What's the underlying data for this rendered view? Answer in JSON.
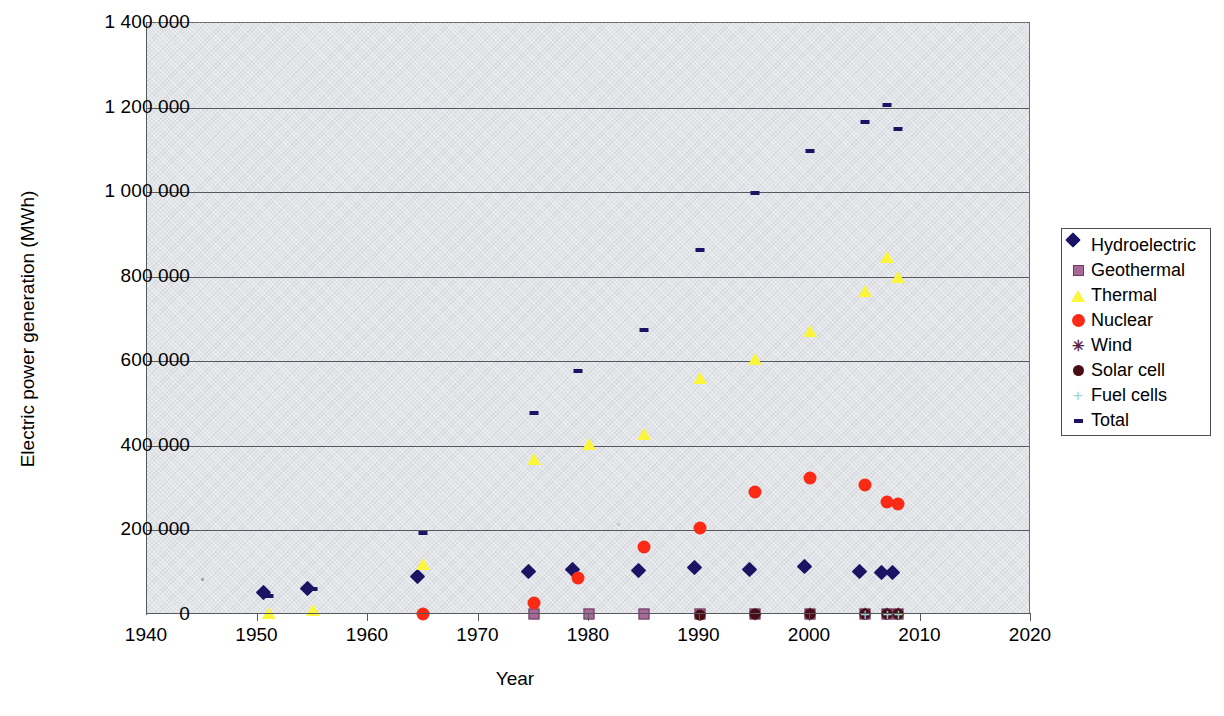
{
  "chart_data": {
    "type": "scatter",
    "title": "",
    "xlabel": "Year",
    "ylabel": "Electric power generation (MWh)",
    "xlim": [
      1940,
      2020
    ],
    "ylim": [
      0,
      1400000
    ],
    "xticks": [
      1940,
      1950,
      1960,
      1970,
      1980,
      1990,
      2000,
      2010,
      2020
    ],
    "yticks": [
      0,
      200000,
      400000,
      600000,
      800000,
      1000000,
      1200000,
      1400000
    ],
    "ytick_labels": [
      "0",
      "200 000",
      "400 000",
      "600 000",
      "800 000",
      "1 000 000",
      "1 200 000",
      "1 400 000"
    ],
    "xtick_labels": [
      "1940",
      "1950",
      "1960",
      "1970",
      "1980",
      "1990",
      "2000",
      "2010",
      "2020"
    ],
    "grid": "horizontal",
    "legend_position": "right",
    "plot_background": "#e3e5e9",
    "series": [
      {
        "name": "Hydroelectric",
        "marker": "diamond",
        "color": "#1b1464",
        "points": [
          {
            "x": 1951,
            "y": 40000
          },
          {
            "x": 1955,
            "y": 50000
          },
          {
            "x": 1965,
            "y": 78000
          },
          {
            "x": 1975,
            "y": 89000
          },
          {
            "x": 1979,
            "y": 95000
          },
          {
            "x": 1985,
            "y": 92000
          },
          {
            "x": 1990,
            "y": 100000
          },
          {
            "x": 1995,
            "y": 95000
          },
          {
            "x": 2000,
            "y": 102000
          },
          {
            "x": 2005,
            "y": 90000
          },
          {
            "x": 2007,
            "y": 88000
          },
          {
            "x": 2008,
            "y": 88000
          }
        ]
      },
      {
        "name": "Geothermal",
        "marker": "square",
        "color": "#a76a96",
        "points": [
          {
            "x": 1975,
            "y": 2000
          },
          {
            "x": 1980,
            "y": 2500
          },
          {
            "x": 1985,
            "y": 3000
          },
          {
            "x": 1990,
            "y": 3500
          },
          {
            "x": 1995,
            "y": 3500
          },
          {
            "x": 2000,
            "y": 3400
          },
          {
            "x": 2005,
            "y": 3200
          },
          {
            "x": 2007,
            "y": 3100
          },
          {
            "x": 2008,
            "y": 3000
          }
        ]
      },
      {
        "name": "Thermal",
        "marker": "triangle",
        "color": "#fbf53c",
        "points": [
          {
            "x": 1951,
            "y": 4000
          },
          {
            "x": 1955,
            "y": 12000
          },
          {
            "x": 1965,
            "y": 120000
          },
          {
            "x": 1975,
            "y": 368000
          },
          {
            "x": 1980,
            "y": 404000
          },
          {
            "x": 1985,
            "y": 428000
          },
          {
            "x": 1990,
            "y": 560000
          },
          {
            "x": 1995,
            "y": 605000
          },
          {
            "x": 2000,
            "y": 672000
          },
          {
            "x": 2005,
            "y": 766000
          },
          {
            "x": 2007,
            "y": 846000
          },
          {
            "x": 2008,
            "y": 800000
          }
        ]
      },
      {
        "name": "Nuclear",
        "marker": "circle",
        "color": "#fb2a14",
        "points": [
          {
            "x": 1965,
            "y": 3000
          },
          {
            "x": 1975,
            "y": 28000
          },
          {
            "x": 1979,
            "y": 88000
          },
          {
            "x": 1985,
            "y": 160000
          },
          {
            "x": 1990,
            "y": 205000
          },
          {
            "x": 1995,
            "y": 292000
          },
          {
            "x": 2000,
            "y": 325000
          },
          {
            "x": 2005,
            "y": 308000
          },
          {
            "x": 2007,
            "y": 268000
          },
          {
            "x": 2008,
            "y": 262000
          }
        ]
      },
      {
        "name": "Wind",
        "marker": "cross",
        "color": "#5b1f47",
        "points": [
          {
            "x": 1995,
            "y": 1000
          },
          {
            "x": 2000,
            "y": 1500
          },
          {
            "x": 2005,
            "y": 2000
          },
          {
            "x": 2007,
            "y": 2500
          },
          {
            "x": 2008,
            "y": 2800
          }
        ]
      },
      {
        "name": "Solar cell",
        "marker": "circle-dark",
        "color": "#4a0d16",
        "points": [
          {
            "x": 1990,
            "y": 1000
          },
          {
            "x": 1995,
            "y": 1200
          },
          {
            "x": 2000,
            "y": 1400
          },
          {
            "x": 2005,
            "y": 1600
          },
          {
            "x": 2007,
            "y": 1800
          },
          {
            "x": 2008,
            "y": 1900
          }
        ]
      },
      {
        "name": "Fuel cells",
        "marker": "plus",
        "color": "#9fd6cf",
        "points": [
          {
            "x": 2005,
            "y": 500
          },
          {
            "x": 2007,
            "y": 600
          },
          {
            "x": 2008,
            "y": 700
          }
        ]
      },
      {
        "name": "Total",
        "marker": "dash",
        "color": "#1b1464",
        "points": [
          {
            "x": 1951,
            "y": 46000
          },
          {
            "x": 1955,
            "y": 62000
          },
          {
            "x": 1965,
            "y": 194000
          },
          {
            "x": 1975,
            "y": 478000
          },
          {
            "x": 1979,
            "y": 578000
          },
          {
            "x": 1985,
            "y": 675000
          },
          {
            "x": 1990,
            "y": 862000
          },
          {
            "x": 1995,
            "y": 997000
          },
          {
            "x": 2000,
            "y": 1097000
          },
          {
            "x": 2005,
            "y": 1165000
          },
          {
            "x": 2007,
            "y": 1205000
          },
          {
            "x": 2008,
            "y": 1150000
          }
        ]
      }
    ]
  },
  "legend": {
    "items": [
      {
        "label": "Hydroelectric",
        "marker": "diamond"
      },
      {
        "label": "Geothermal",
        "marker": "square"
      },
      {
        "label": "Thermal",
        "marker": "triangle"
      },
      {
        "label": "Nuclear",
        "marker": "circle"
      },
      {
        "label": "Wind",
        "marker": "cross"
      },
      {
        "label": "Solar cell",
        "marker": "circle-dark"
      },
      {
        "label": "Fuel cells",
        "marker": "plus"
      },
      {
        "label": "Total",
        "marker": "dash"
      }
    ]
  },
  "glyphs": {
    "cross": "✳",
    "plus": "+"
  }
}
